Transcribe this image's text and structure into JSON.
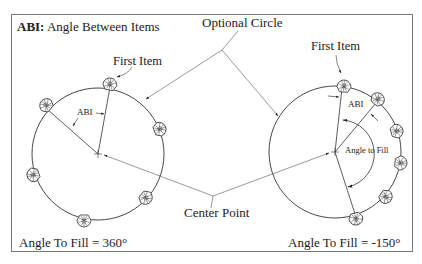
{
  "diagram": {
    "title_bold": "ABI:",
    "title_rest": " Angle Between Items",
    "labels": {
      "optional_circle": "Optional Circle",
      "first_item_left": "First Item",
      "first_item_right": "First Item",
      "center_point": "Center Point",
      "abi_left": "ABI",
      "abi_right": "ABI",
      "angle_to_fill_inner": "Angle to Fill",
      "angle_to_fill_left": "Angle To Fill = 360°",
      "angle_to_fill_right": "Angle To Fill = -150°"
    },
    "left_pattern": {
      "angle_to_fill_deg": 360,
      "item_count": 6,
      "center": [
        98,
        154
      ],
      "radius": 66
    },
    "right_pattern": {
      "angle_to_fill_deg": -150,
      "item_count": 6,
      "center": [
        335,
        152
      ],
      "radius": 66
    },
    "colors": {
      "line": "#333333",
      "frame": "#777777",
      "background": "#ffffff"
    }
  }
}
